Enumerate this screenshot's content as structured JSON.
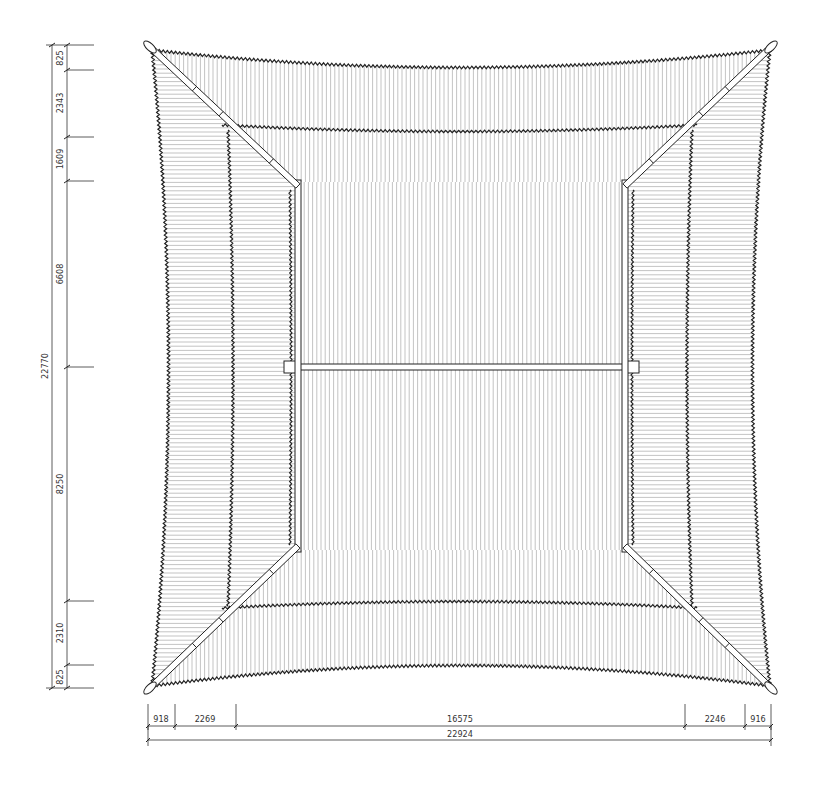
{
  "drawing": {
    "title": "Hip roof plan",
    "stroke_color": "#222222",
    "hatch_color": "#9a9a9a",
    "background": "#ffffff"
  },
  "dimensions": {
    "vertical": {
      "overall": "22770",
      "segments": [
        "825",
        "2343",
        "1609",
        "6608",
        "8250",
        "2310",
        "825"
      ]
    },
    "horizontal": {
      "overall": "22924",
      "segments": [
        "918",
        "2269",
        "16575",
        "2246",
        "916"
      ]
    }
  }
}
